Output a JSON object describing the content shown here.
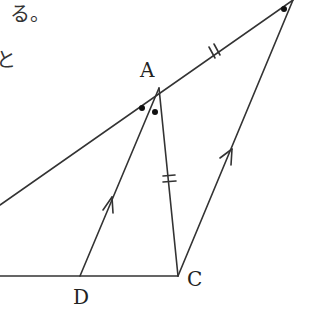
{
  "text_fragments": {
    "line1": "る。",
    "line2": "と"
  },
  "points": {
    "A": {
      "label": "A",
      "x": 159,
      "y": 88
    },
    "C": {
      "label": "C",
      "x": 178,
      "y": 276
    },
    "D": {
      "label": "D",
      "x": 80,
      "y": 276
    },
    "E": {
      "label": "",
      "x": 293,
      "y": 0
    }
  },
  "segments": [
    {
      "name": "line-through-A",
      "from": "left-edge",
      "to": "E"
    },
    {
      "name": "base-line",
      "from": "left-edge",
      "to": "C"
    },
    {
      "name": "segment-AD",
      "from": "A",
      "to": "D",
      "marker": "parallel-arrow"
    },
    {
      "name": "segment-AC",
      "from": "A",
      "to": "C",
      "marker": "double-tick"
    },
    {
      "name": "segment-CE",
      "from": "C",
      "to": "E",
      "marker": "parallel-arrow"
    },
    {
      "name": "segment-AE",
      "from": "A",
      "to": "E",
      "marker": "double-tick"
    }
  ],
  "angle_marks": [
    {
      "at": "A",
      "type": "dot",
      "count": 2
    },
    {
      "at": "E",
      "type": "dot",
      "count": 1
    }
  ],
  "colors": {
    "stroke": "#333333",
    "background": "#ffffff"
  }
}
